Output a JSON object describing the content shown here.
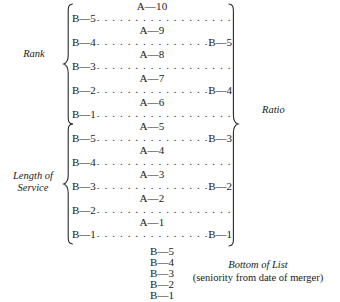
{
  "figure": {
    "type": "seniority-integration-diagram",
    "labels": {
      "rank": "Rank",
      "length_of_service": "Length of\nService",
      "ratio": "Ratio",
      "bottom_of_list_title": "Bottom of List",
      "bottom_of_list_subtitle": "(seniority from date of merger)"
    },
    "sections": [
      {
        "id": "rank",
        "label": "Rank",
        "rows": [
          {
            "kind": "a",
            "left": "A—10"
          },
          {
            "kind": "b",
            "left": "B—5",
            "right": ""
          },
          {
            "kind": "a",
            "left": "A—9"
          },
          {
            "kind": "b",
            "left": "B—4",
            "right": "B—5"
          },
          {
            "kind": "a",
            "left": "A—8"
          },
          {
            "kind": "b",
            "left": "B—3",
            "right": ""
          },
          {
            "kind": "a",
            "left": "A—7"
          },
          {
            "kind": "b",
            "left": "B—2",
            "right": "B—4"
          },
          {
            "kind": "a",
            "left": "A—6"
          },
          {
            "kind": "b",
            "left": "B—1",
            "right": ""
          }
        ]
      },
      {
        "id": "length-of-service",
        "label": "Length of Service",
        "rows": [
          {
            "kind": "a",
            "left": "A—5"
          },
          {
            "kind": "b",
            "left": "B—5",
            "right": "B—3"
          },
          {
            "kind": "a",
            "left": "A—4"
          },
          {
            "kind": "b",
            "left": "B—4",
            "right": ""
          },
          {
            "kind": "a",
            "left": "A—3"
          },
          {
            "kind": "b",
            "left": "B—3",
            "right": "B—2"
          },
          {
            "kind": "a",
            "left": "A—2"
          },
          {
            "kind": "b",
            "left": "B—2",
            "right": ""
          },
          {
            "kind": "a",
            "left": "A—1"
          },
          {
            "kind": "b",
            "left": "B—1",
            "right": "B—1"
          }
        ]
      }
    ],
    "bottom_list": [
      "B—5",
      "B—4",
      "B—3",
      "B—2",
      "B—1"
    ],
    "leader": {
      "full": ". . . . . . . . . . . . . . . . . . . . . . . . .",
      "short": ". . . . . . . . . . . . . . . . . . . . ."
    },
    "colors": {
      "ink": "#1a1a1a",
      "paper": "#ffffff"
    }
  }
}
